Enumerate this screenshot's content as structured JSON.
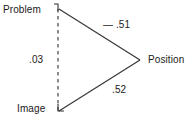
{
  "diagram": {
    "type": "path-diagram",
    "background_color": "#ffffff",
    "line_color": "#333333",
    "text_color": "#1a1a1a",
    "nodes": [
      {
        "id": "problem",
        "label": "Problem",
        "x": 58,
        "y": 9
      },
      {
        "id": "image",
        "label": "Image",
        "x": 58,
        "y": 111
      },
      {
        "id": "position",
        "label": "Position",
        "x": 140,
        "y": 60
      }
    ],
    "edges": [
      {
        "id": "problem-position",
        "from": "problem",
        "to": "position",
        "style": "solid",
        "label": "— .51"
      },
      {
        "id": "image-position",
        "from": "image",
        "to": "position",
        "style": "solid",
        "label": ".52"
      },
      {
        "id": "problem-image",
        "from": "problem",
        "to": "image",
        "style": "dashed",
        "label": ".03"
      }
    ]
  }
}
